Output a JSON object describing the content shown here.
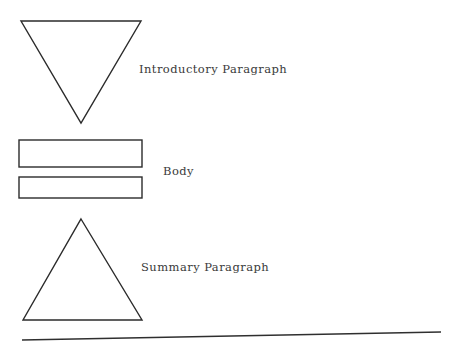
{
  "document": {
    "title": "Essay Structure Diagram",
    "background_color": "#ffffff",
    "width": 451,
    "height": 354
  },
  "diagram": {
    "type": "essay-structure",
    "stroke_color": "#2b2b2b",
    "rule_color": "#2f2f2f",
    "text_color": "#3a3a3a",
    "shapes": [
      {
        "name": "inverted-triangle",
        "kind": "triangle-down",
        "points": "21,21 141,21 81,123"
      },
      {
        "name": "body-rectangle-top",
        "kind": "rectangle",
        "x": 19,
        "y": 140,
        "width": 123,
        "height": 27
      },
      {
        "name": "body-rectangle-bottom",
        "kind": "rectangle",
        "x": 19,
        "y": 177,
        "width": 123,
        "height": 21
      },
      {
        "name": "upright-triangle",
        "kind": "triangle-up",
        "points": "81,219 142,320 23,320"
      },
      {
        "name": "baseline-rule",
        "kind": "line",
        "x1": 22,
        "y1": 340,
        "x2": 441,
        "y2": 332
      }
    ],
    "labels": {
      "intro": "Introductory Paragraph",
      "body": "Body",
      "summary": "Summary Paragraph"
    }
  }
}
